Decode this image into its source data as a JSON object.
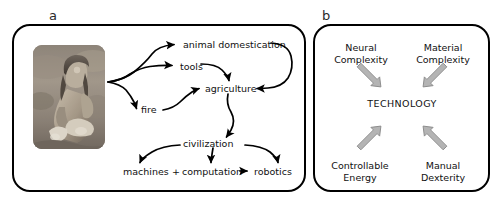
{
  "figure": {
    "background_color": "#ffffff",
    "panels": [
      {
        "key": "a",
        "label": "a",
        "border_color": "#000000",
        "image": {
          "name": "early-human-knapping-stone-photo",
          "description": "grayscale photograph of an early human seated on the ground working a stone"
        },
        "nodes": {
          "animal_domestication": "animal domestication",
          "tools": "tools",
          "agriculture": "agriculture",
          "fire": "fire",
          "civilization": "civilization",
          "machines": "machines",
          "plus": "+",
          "computation": "computation",
          "robotics": "robotics"
        },
        "arrow_color": "#000000"
      },
      {
        "key": "b",
        "label": "b",
        "border_color": "#000000",
        "nodes": {
          "neural_complexity": "Neural\nComplexity",
          "neural_complexity_line1": "Neural",
          "neural_complexity_line2": "Complexity",
          "material_complexity_line1": "Material",
          "material_complexity_line2": "Complexity",
          "technology": "TECHNOLOGY",
          "controllable_energy_line1": "Controllable",
          "controllable_energy_line2": "Energy",
          "manual_dexterity_line1": "Manual",
          "manual_dexterity_line2": "Dexterity"
        },
        "arrow_fill_color": "#b4b4b4",
        "arrow_stroke_color": "#8a8a8a"
      }
    ]
  }
}
